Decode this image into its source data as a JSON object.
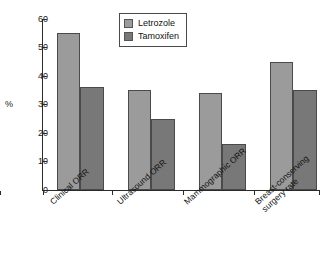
{
  "chart_data": {
    "type": "bar",
    "title": "",
    "xlabel": "",
    "ylabel": "%",
    "ylim": [
      0,
      60
    ],
    "yticks": [
      0,
      10,
      20,
      30,
      40,
      50,
      60
    ],
    "grid": false,
    "legend_position": "top-center",
    "categories": [
      "Clinical ORR",
      "Ultrasound ORR",
      "Mammographic ORR",
      "Breast-conserving\nsurgery rate"
    ],
    "category_labels_flat": [
      "Clinical ORR",
      "Ultrasound ORR",
      "Mammographic ORR",
      "Breast-conserving surgery rate"
    ],
    "series": [
      {
        "name": "Letrozole",
        "color": "#9b9b9b",
        "values": [
          55,
          35,
          34,
          45
        ]
      },
      {
        "name": "Tamoxifen",
        "color": "#787878",
        "values": [
          36,
          25,
          16,
          35
        ]
      }
    ]
  },
  "legend": {
    "entries": [
      {
        "label": "Letrozole"
      },
      {
        "label": "Tamoxifen"
      }
    ]
  },
  "axes": {
    "y_title": "%",
    "y_tick_labels": [
      "60",
      "50",
      "40",
      "30",
      "20",
      "10",
      "0"
    ]
  }
}
